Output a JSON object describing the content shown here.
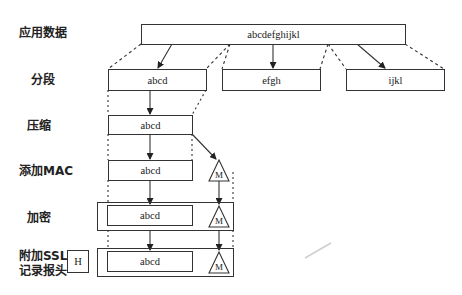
{
  "diagram": {
    "stages": [
      {
        "id": "app-data",
        "label": "应用数据"
      },
      {
        "id": "fragment",
        "label": "分段"
      },
      {
        "id": "compress",
        "label": "压缩"
      },
      {
        "id": "add-mac",
        "label": "添加MAC"
      },
      {
        "id": "encrypt",
        "label": "加密"
      },
      {
        "id": "add-header",
        "label_line1": "附加SSL",
        "label_line2": "记录报头"
      }
    ],
    "boxes": {
      "app_data": "abcdefghijkl",
      "fragments": [
        "abcd",
        "efgh",
        "ijkl"
      ],
      "compressed": "abcd",
      "with_mac": "abcd",
      "encrypted": "abcd",
      "record": "abcd",
      "mac_symbol": "M",
      "header_symbol": "H"
    }
  }
}
